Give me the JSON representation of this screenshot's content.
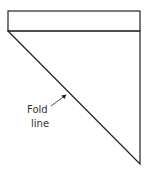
{
  "diagram": {
    "label_line1": "Fold",
    "label_line2": "line",
    "stroke_color": "#222222",
    "shapes": {
      "top_strip": {
        "x": 8,
        "y": 11,
        "width": 132,
        "height": 20
      },
      "triangle": {
        "points": [
          [
            8,
            31
          ],
          [
            140,
            31
          ],
          [
            140,
            164
          ]
        ]
      },
      "arrow": {
        "from": [
          51,
          106
        ],
        "to": [
          67,
          94
        ]
      }
    }
  }
}
